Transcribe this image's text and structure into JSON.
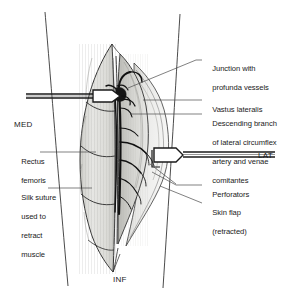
{
  "figure": {
    "type": "anatomical-illustration",
    "colors": {
      "ink": "#1a1a1a",
      "background": "#ffffff",
      "muscle_fill": "#d8d8d4",
      "muscle_fill_light": "#e8e8e6",
      "flap_fill": "#efefee",
      "vessel": "#111111",
      "leader": "#4a4a4a"
    }
  },
  "orientation": {
    "medial": "MED",
    "lateral": "LAT",
    "inferior": "INF"
  },
  "labels": {
    "junction": {
      "line1": "Junction with",
      "line2": "profunda vessels"
    },
    "vastus": {
      "line1": "Vastus lateralis"
    },
    "descending": {
      "line1": "Descending branch",
      "line2": "of lateral circumflex",
      "line3": "artery and venae",
      "line4": "comitantes"
    },
    "perforators": {
      "line1": "Perforators"
    },
    "skin_flap": {
      "line1": "Skin flap",
      "line2": "(retracted)"
    },
    "rectus": {
      "line1": "Rectus",
      "line2": "femoris"
    },
    "silk_suture": {
      "line1": "Silk suture",
      "line2": "used to",
      "line3": "retract",
      "line4": "muscle"
    }
  }
}
